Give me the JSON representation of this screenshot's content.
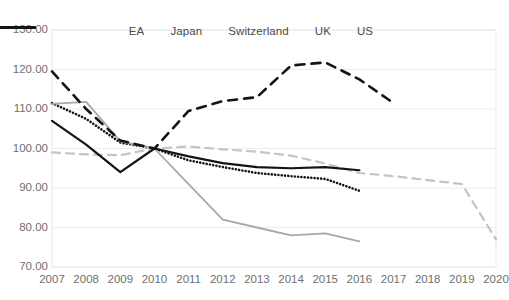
{
  "chart_data": {
    "type": "line",
    "title": "",
    "subtitle": "",
    "xlabel": "",
    "ylabel": "",
    "grid": true,
    "legend_position": "top",
    "x": [
      2007,
      2008,
      2009,
      2010,
      2011,
      2012,
      2013,
      2014,
      2015,
      2016,
      2017,
      2018,
      2019,
      2020
    ],
    "xticklabels": [
      "2007",
      "2008",
      "2009",
      "2010",
      "2011",
      "2012",
      "2013",
      "2014",
      "2015",
      "2016",
      "2017",
      "2018",
      "2019",
      "2020"
    ],
    "yticklabels": [
      "130.00",
      "120.00",
      "110.00",
      "100.00",
      "90.00",
      "80.00",
      "70.00"
    ],
    "yticks": [
      130,
      120,
      110,
      100,
      90,
      80,
      70
    ],
    "ylim": [
      70,
      130
    ],
    "xlim": [
      2007,
      2020
    ],
    "series": [
      {
        "name": "EA",
        "style": "dashed",
        "color": "#c4c4c4",
        "width": 2.2,
        "x": [
          2007,
          2008,
          2009,
          2010,
          2011,
          2012,
          2013,
          2014,
          2015,
          2016,
          2017,
          2018,
          2019,
          2020
        ],
        "values": [
          99.0,
          98.5,
          98.3,
          100.0,
          100.5,
          99.8,
          99.2,
          98.2,
          96.2,
          93.8,
          93.0,
          92.0,
          91.0,
          77.0
        ]
      },
      {
        "name": "Japan",
        "style": "dotted",
        "color": "#141414",
        "width": 2.6,
        "x": [
          2007,
          2008,
          2009,
          2010,
          2011,
          2012,
          2013,
          2014,
          2015,
          2016
        ],
        "values": [
          111.5,
          107.5,
          101.5,
          100.0,
          97.0,
          95.3,
          93.8,
          93.0,
          92.3,
          89.3
        ]
      },
      {
        "name": "Switzerland",
        "style": "solid",
        "color": "#a8a8a8",
        "width": 1.8,
        "x": [
          2007,
          2008,
          2009,
          2010,
          2011,
          2012,
          2013,
          2014,
          2015,
          2016
        ],
        "values": [
          111.3,
          111.8,
          101.8,
          100.0,
          91.0,
          82.0,
          80.0,
          78.0,
          78.5,
          76.5
        ]
      },
      {
        "name": "UK",
        "style": "dashed-thick",
        "color": "#141414",
        "width": 2.6,
        "x": [
          2007,
          2008,
          2009,
          2010,
          2011,
          2012,
          2013,
          2014,
          2015,
          2016,
          2017
        ],
        "values": [
          119.5,
          110.0,
          102.0,
          100.0,
          109.5,
          112.0,
          113.0,
          121.0,
          121.8,
          117.5,
          111.5
        ]
      },
      {
        "name": "US",
        "style": "solid",
        "color": "#141414",
        "width": 2.2,
        "x": [
          2007,
          2008,
          2009,
          2010,
          2011,
          2012,
          2013,
          2014,
          2015,
          2016
        ],
        "values": [
          107.0,
          101.0,
          94.0,
          100.0,
          98.0,
          96.3,
          95.3,
          95.0,
          95.3,
          94.5
        ]
      }
    ]
  },
  "legend": {
    "items": [
      {
        "label": "EA"
      },
      {
        "label": "Japan"
      },
      {
        "label": "Switzerland"
      },
      {
        "label": "UK"
      },
      {
        "label": "US"
      }
    ]
  }
}
